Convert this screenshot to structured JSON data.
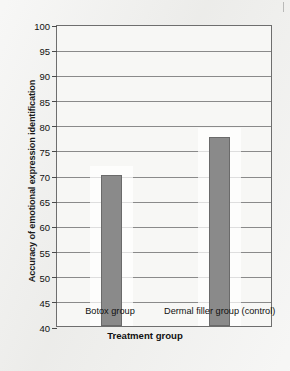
{
  "chart_data": {
    "type": "bar",
    "title": "",
    "xlabel": "Treatment group",
    "ylabel": "Accuracy of emotional expression identification",
    "categories": [
      "Botox group",
      "Dermal filler group (control)"
    ],
    "values": [
      70,
      77.5
    ],
    "ylim": [
      40,
      100
    ],
    "yticks": [
      40,
      45,
      50,
      55,
      60,
      65,
      70,
      75,
      80,
      85,
      90,
      95,
      100
    ],
    "ytick_labels": [
      "40",
      "45",
      "50",
      "55",
      "60",
      "65",
      "70",
      "75",
      "80",
      "85",
      "90",
      "95",
      "100"
    ],
    "grid": true,
    "legend": false,
    "legend_position": "none",
    "bar_color": "#8a8a8a",
    "plot_background": "#f7f7f5",
    "axis_color": "#6e6e6e",
    "gridline_color": "#8a8a8a"
  }
}
